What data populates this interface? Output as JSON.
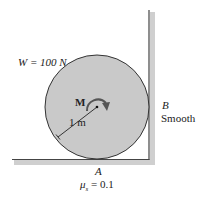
{
  "diagram": {
    "weight_label": "W = 100 N",
    "moment_label": "M",
    "radius_label": "1 m",
    "point_b": "B",
    "wall_label": "Smooth",
    "point_a": "A",
    "friction_mu": "μ",
    "friction_sub": "s",
    "friction_value": " = 0.1",
    "colors": {
      "disk_fill": "#c9c9c9",
      "disk_stroke": "#333333",
      "surface_line": "#444444",
      "shadow": "#bdbdbd",
      "moment_arrow": "#555555"
    }
  }
}
